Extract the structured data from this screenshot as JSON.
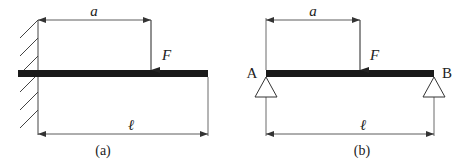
{
  "figure": {
    "type": "beam-loading-diagram",
    "panels": [
      {
        "id": "a",
        "caption": "(a)",
        "support": "fixed-wall-cantilever",
        "labels": {
          "load_distance": "a",
          "force": "F",
          "length": "ℓ"
        }
      },
      {
        "id": "b",
        "caption": "(b)",
        "support": "simply-supported",
        "labels": {
          "load_distance": "a",
          "force": "F",
          "length": "ℓ",
          "left_support": "A",
          "right_support": "B"
        }
      }
    ],
    "colors": {
      "beam": "#1a1a1a",
      "line": "#333333",
      "background": "#ffffff"
    }
  }
}
